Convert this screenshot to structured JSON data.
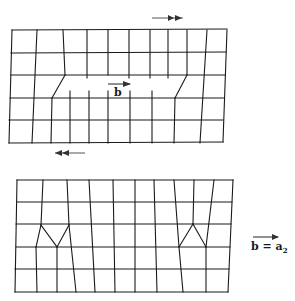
{
  "figure": {
    "top_panel": {
      "name": "crystal-with-edge-dislocation-pair",
      "shear_arrow": {
        "direction": "right",
        "x1": 152,
        "x2": 183,
        "y": 18
      },
      "burgers_vector_label": "b",
      "lines": [
        [
          12,
          30,
          227,
          29
        ],
        [
          11,
          53,
          226,
          52
        ],
        [
          11,
          75,
          225,
          75
        ],
        [
          10,
          98,
          224,
          98
        ],
        [
          9,
          120,
          223,
          120
        ],
        [
          9,
          143,
          223,
          142
        ],
        [
          12,
          30,
          9,
          143
        ],
        [
          37,
          30,
          32,
          143
        ],
        [
          63,
          30,
          65,
          75
        ],
        [
          65,
          75,
          52,
          98
        ],
        [
          52,
          98,
          51,
          143
        ],
        [
          87,
          30,
          87,
          78
        ],
        [
          108,
          30,
          108,
          75
        ],
        [
          129,
          30,
          129,
          78
        ],
        [
          150,
          30,
          150,
          78
        ],
        [
          168,
          30,
          168,
          78
        ],
        [
          187,
          30,
          187,
          75
        ],
        [
          187,
          75,
          175,
          98
        ],
        [
          175,
          98,
          174,
          143
        ],
        [
          207,
          30,
          200,
          143
        ],
        [
          227,
          30,
          223,
          142
        ],
        [
          70,
          91,
          70,
          143
        ],
        [
          89,
          91,
          89,
          143
        ],
        [
          108,
          91,
          108,
          143
        ],
        [
          130,
          91,
          130,
          143
        ],
        [
          152,
          91,
          152,
          143
        ]
      ]
    },
    "bottom_panel": {
      "name": "crystal-with-two-dislocations-slipped",
      "shear_arrow": {
        "direction": "left",
        "x1": 85,
        "x2": 55,
        "y": 153
      },
      "lines": [
        [
          17,
          180,
          233,
          180
        ],
        [
          17,
          202,
          232,
          202
        ],
        [
          16,
          224,
          231,
          224
        ],
        [
          16,
          247,
          230,
          247
        ],
        [
          15,
          269,
          229,
          269
        ],
        [
          15,
          292,
          228,
          292
        ],
        [
          17,
          180,
          15,
          292
        ],
        [
          43,
          180,
          41,
          225
        ],
        [
          41,
          225,
          36,
          247
        ],
        [
          36,
          247,
          37,
          292
        ],
        [
          41,
          225,
          57,
          247
        ],
        [
          67,
          180,
          69,
          225
        ],
        [
          69,
          225,
          57,
          247
        ],
        [
          57,
          247,
          57,
          292
        ],
        [
          69,
          225,
          76,
          292
        ],
        [
          89,
          180,
          95,
          292
        ],
        [
          113,
          180,
          115,
          292
        ],
        [
          135,
          180,
          135,
          292
        ],
        [
          154,
          180,
          157,
          292
        ],
        [
          174,
          180,
          179,
          247
        ],
        [
          179,
          247,
          183,
          292
        ],
        [
          179,
          247,
          193,
          224
        ],
        [
          193,
          224,
          206,
          247
        ],
        [
          194,
          180,
          193,
          224
        ],
        [
          214,
          180,
          206,
          247
        ],
        [
          206,
          247,
          206,
          292
        ],
        [
          233,
          180,
          228,
          292
        ]
      ]
    },
    "legend": {
      "text": "b = a",
      "subscript": "2"
    }
  }
}
